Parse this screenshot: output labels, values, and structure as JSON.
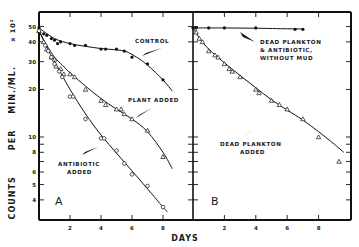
{
  "chart_data": {
    "type": "scatter",
    "title": "",
    "xlabel": "DAYS",
    "ylabel": "COUNTS PER MIN./ML. x 10²",
    "yscale": "log",
    "ylim": [
      3,
      55
    ],
    "yticks": [
      4,
      5,
      6,
      7,
      8,
      9,
      10,
      20,
      30,
      40,
      50
    ],
    "ytick_labels": [
      "4",
      "5",
      "6",
      "",
      "8",
      "",
      "10",
      "20",
      "30",
      "40",
      "50"
    ],
    "xticks": [
      2,
      4,
      6,
      8
    ],
    "xtick_labels": [
      "2",
      "4",
      "6",
      "8"
    ],
    "grid": false,
    "panels": [
      {
        "label": "A",
        "xlim": [
          0,
          10
        ],
        "series": [
          {
            "name": "CONTROL",
            "marker": "filled-circle",
            "x": [
              0,
              0.3,
              0.5,
              0.8,
              1,
              1.2,
              1.4,
              2,
              2.3,
              3,
              4,
              4.3,
              5,
              5.5,
              6,
              7,
              8
            ],
            "y": [
              49,
              45,
              44,
              42,
              41,
              39,
              40,
              39,
              38,
              38,
              36,
              36,
              36,
              35,
              32,
              29,
              23
            ],
            "curve_x": [
              0,
              1,
              2,
              3,
              4,
              5,
              5.6,
              6.3,
              7,
              8,
              8.6
            ],
            "curve_y": [
              49,
              42,
              39,
              37.5,
              36.3,
              35.6,
              34.8,
              32,
              28.5,
              23,
              19.5
            ]
          },
          {
            "name": "PLANT ADDED",
            "marker": "open-triangle",
            "x": [
              0,
              0.3,
              0.5,
              0.8,
              1,
              1.1,
              1.4,
              1.6,
              2,
              2.3,
              3,
              4,
              4.3,
              5,
              5.3,
              5.5,
              6,
              7,
              8
            ],
            "y": [
              47,
              40,
              36,
              32,
              31,
              28,
              27,
              25,
              25,
              24,
              20,
              17,
              16,
              15,
              15,
              14,
              13,
              11,
              7.5
            ],
            "curve_x": [
              0,
              0.5,
              1,
              1.5,
              2,
              3,
              4,
              5,
              6,
              7,
              8,
              8.6
            ],
            "curve_y": [
              47,
              38,
              32,
              28.5,
              25.5,
              21,
              17.5,
              15,
              13,
              10.8,
              8,
              6.3
            ]
          },
          {
            "name": "ANTIBIOTIC ADDED",
            "marker": "open-circle",
            "x": [
              0,
              0.4,
              0.6,
              0.8,
              1,
              1.3,
              1.5,
              2,
              2.2,
              3,
              4,
              4.2,
              5,
              5.5,
              6,
              7,
              8
            ],
            "y": [
              47,
              38,
              35,
              32,
              29,
              26,
              24,
              18,
              18,
              13,
              9.8,
              9.8,
              8.2,
              6.8,
              5.8,
              4.9,
              3.6
            ],
            "curve_x": [
              0,
              0.5,
              1,
              1.5,
              2,
              3,
              4,
              5,
              6,
              7,
              8,
              8.3
            ],
            "curve_y": [
              47,
              37,
              30,
              24.5,
              20,
              14,
              10.3,
              7.9,
              6.1,
              4.7,
              3.6,
              3.35
            ]
          }
        ],
        "annotations": [
          {
            "text": [
              "CONTROL"
            ],
            "x": 135,
            "y": 43
          },
          {
            "text": [
              "PLANT ADDED"
            ],
            "x": 128,
            "y": 102
          },
          {
            "text": [
              "ANTIBIOTIC",
              "ADDED"
            ],
            "x": 58,
            "y": 166
          }
        ]
      },
      {
        "label": "B",
        "xlim": [
          0,
          10
        ],
        "series": [
          {
            "name": "DEAD PLANKTON & ANTIBIOTIC, WITHOUT MUD",
            "marker": "filled-circle",
            "x": [
              0,
              0.2,
              1,
              2,
              4,
              6.5,
              7
            ],
            "y": [
              49,
              49,
              49,
              49,
              49,
              48,
              48
            ],
            "curve_x": [
              0,
              2,
              4,
              6,
              7
            ],
            "curve_y": [
              49,
              49,
              48.8,
              48.4,
              48.3
            ]
          },
          {
            "name": "DEAD PLANKTON ADDED",
            "marker": "open-triangle",
            "x": [
              0.2,
              0.4,
              0.6,
              1,
              1.4,
              1.6,
              2,
              2.3,
              2.5,
              3,
              4,
              4.2,
              5,
              5.5,
              6,
              7,
              8,
              9.3
            ],
            "y": [
              46,
              42,
              40,
              35,
              33,
              32,
              29,
              27,
              26,
              24,
              20,
              19,
              17,
              16,
              15,
              13,
              10,
              7
            ],
            "curve_x": [
              0,
              0.5,
              1,
              1.5,
              2,
              3,
              4,
              5,
              6,
              7,
              8,
              9,
              9.6
            ],
            "curve_y": [
              49,
              41,
              36,
              32.5,
              29.5,
              24.5,
              20.5,
              17.2,
              14.8,
              12.8,
              10.8,
              9,
              8
            ]
          }
        ],
        "annotations": [
          {
            "text": [
              "DEAD PLANKTON",
              "& ANTIBIOTIC,",
              "WITHOUT MUD"
            ],
            "x": 260,
            "y": 44
          },
          {
            "text": [
              "DEAD PLANKTON",
              "ADDED"
            ],
            "x": 220,
            "y": 146
          }
        ]
      }
    ]
  },
  "figure": {
    "ylabel_words": [
      "COUNTS",
      "PER",
      "MIN./ML.",
      "x 10²"
    ],
    "xlabel": "DAYS",
    "panel_a_label": "A",
    "panel_b_label": "B"
  }
}
